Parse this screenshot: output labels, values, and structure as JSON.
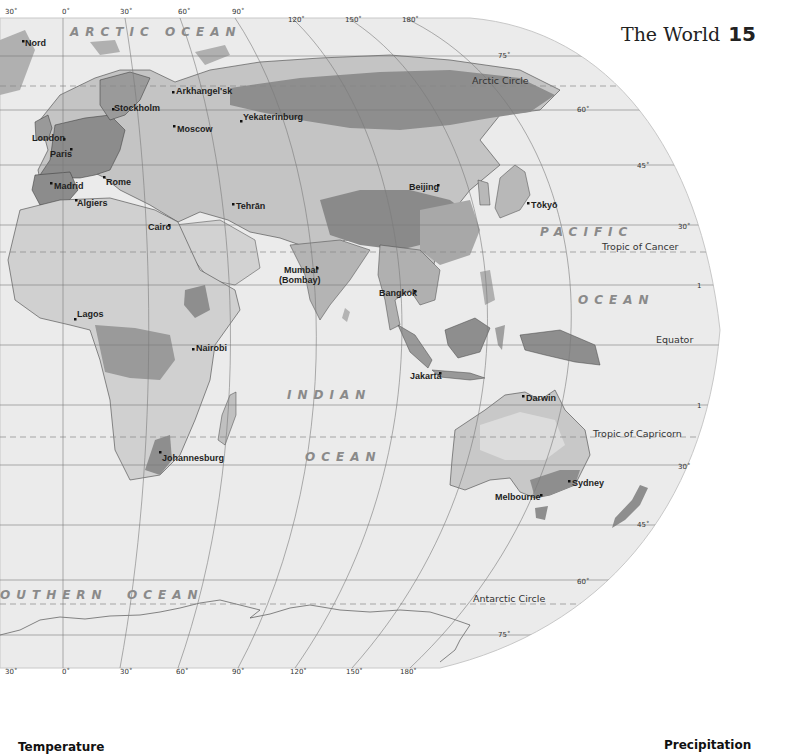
{
  "page": {
    "title": "The World",
    "page_number": "15"
  },
  "legend": {
    "temperature_heading": "Temperature",
    "precipitation_heading": "Precipitation"
  },
  "oceans": [
    {
      "id": "arctic",
      "label": "ARCTIC OCEAN"
    },
    {
      "id": "pacific-1",
      "label": "PACIFIC"
    },
    {
      "id": "pacific-2",
      "label": "OCEAN"
    },
    {
      "id": "indian-1",
      "label": "INDIAN"
    },
    {
      "id": "indian-2",
      "label": "OCEAN"
    },
    {
      "id": "southern-1",
      "label": "OUTHERN"
    },
    {
      "id": "southern-2",
      "label": "OCEAN"
    }
  ],
  "cities": [
    {
      "name": "Nord"
    },
    {
      "name": "Arkhangel'sk"
    },
    {
      "name": "Stockholm"
    },
    {
      "name": "Moscow"
    },
    {
      "name": "Yekaterinburg"
    },
    {
      "name": "London"
    },
    {
      "name": "Paris"
    },
    {
      "name": "Madrid"
    },
    {
      "name": "Rome"
    },
    {
      "name": "Algiers"
    },
    {
      "name": "Tehrān"
    },
    {
      "name": "Cairo"
    },
    {
      "name": "Beijing"
    },
    {
      "name": "Tōkyō"
    },
    {
      "name": "Mumbai"
    },
    {
      "name": "(Bombay)"
    },
    {
      "name": "Bangkok"
    },
    {
      "name": "Lagos"
    },
    {
      "name": "Nairobi"
    },
    {
      "name": "Jakarta"
    },
    {
      "name": "Darwin"
    },
    {
      "name": "Johannesburg"
    },
    {
      "name": "Sydney"
    },
    {
      "name": "Melbourne"
    }
  ],
  "lines": {
    "arctic_circle": "Arctic Circle",
    "tropic_cancer": "Tropic of Cancer",
    "equator": "Equator",
    "tropic_capricorn": "Tropic of Capricorn",
    "antarctic_circle": "Antarctic Circle"
  },
  "longitude_ticks": [
    "30˚",
    "0˚",
    "30˚",
    "60˚",
    "90˚",
    "120˚",
    "150˚",
    "180˚"
  ],
  "latitude_ticks": [
    "75˚",
    "60˚",
    "45˚",
    "30˚",
    "1",
    "1",
    "30˚",
    "45˚",
    "60˚",
    "75˚"
  ]
}
